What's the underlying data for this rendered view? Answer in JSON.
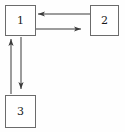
{
  "diagram": {
    "background_color": "#fefefe",
    "stroke_color": "#3a3a3a",
    "box_border_color": "#6b6b6b",
    "label_color": "#1a1a1a",
    "nodes": [
      {
        "id": "1",
        "label": "1",
        "x": 5,
        "y": 5,
        "width": 31,
        "height": 31
      },
      {
        "id": "2",
        "label": "2",
        "x": 90,
        "y": 5,
        "width": 29,
        "height": 31
      },
      {
        "id": "3",
        "label": "3",
        "x": 5,
        "y": 95,
        "width": 31,
        "height": 33
      }
    ],
    "edges": [
      {
        "id": "edge-2-to-1",
        "from": "2",
        "to": "1",
        "direction": "left",
        "label": "",
        "x1": 90,
        "y1": 14,
        "x2": 38,
        "y2": 14
      },
      {
        "id": "edge-1-to-2",
        "from": "1",
        "to": "2",
        "direction": "right",
        "label": "",
        "x1": 36,
        "y1": 29,
        "x2": 81,
        "y2": 29
      },
      {
        "id": "edge-3-to-1",
        "from": "3",
        "to": "1",
        "direction": "up",
        "label": "",
        "x1": 11,
        "y1": 94,
        "x2": 11,
        "y2": 39
      },
      {
        "id": "edge-1-to-3",
        "from": "1",
        "to": "3",
        "direction": "down",
        "label": "",
        "x1": 21,
        "y1": 37,
        "x2": 21,
        "y2": 89
      }
    ]
  }
}
